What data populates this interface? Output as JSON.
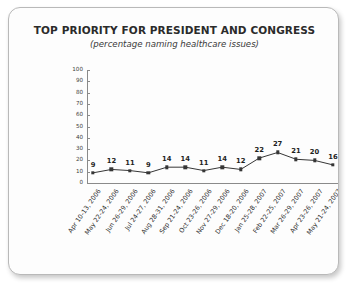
{
  "chart_data": {
    "type": "line",
    "title": "TOP PRIORITY FOR PRESIDENT AND CONGRESS",
    "subtitle": "(percentage naming healthcare issues)",
    "xlabel": "",
    "ylabel": "",
    "ylim": [
      0,
      100
    ],
    "yticks": [
      100,
      90,
      80,
      70,
      60,
      50,
      40,
      30,
      20,
      10,
      0
    ],
    "grid": false,
    "legend": "none",
    "marker": "square",
    "series_color": "#363636",
    "categories": [
      "Apr 10-13, 2006",
      "May 22-24, 2006",
      "Jun 26-29, 2006",
      "Jul 24-27, 2006",
      "Aug 28-31, 2006",
      "Sep 21-24, 2006",
      "Oct 23-26, 2006",
      "Nov 27-29, 2006",
      "Dec 18-20, 2006",
      "Jan 25-28, 2007",
      "Feb 22-25, 2007",
      "Mar 26-29, 2007",
      "Apr 23-26, 2007",
      "May 21-24, 2007"
    ],
    "values": [
      9,
      12,
      11,
      9,
      14,
      14,
      11,
      14,
      12,
      22,
      27,
      21,
      20,
      16
    ],
    "data_labels": [
      "9",
      "12",
      "11",
      "9",
      "14",
      "14",
      "11",
      "14",
      "12",
      "22",
      "27",
      "21",
      "20",
      "16"
    ]
  },
  "colors": {
    "card_background": "#fdfdfd",
    "page_background": "#ffffff",
    "axis": "#8a8a8a",
    "series": "#363636",
    "title_text": "#2b2b2b"
  }
}
